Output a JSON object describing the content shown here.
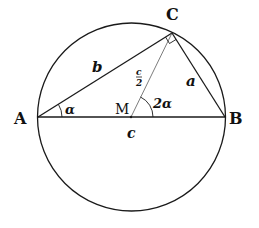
{
  "diagram": {
    "points": {
      "A": {
        "label": "A",
        "x": 38,
        "y": 117
      },
      "B": {
        "label": "B",
        "x": 225,
        "y": 117
      },
      "C": {
        "label": "C",
        "x": 172,
        "y": 33
      },
      "M": {
        "label": "M",
        "x": 131,
        "y": 117
      }
    },
    "circle": {
      "cx": 131.5,
      "cy": 117,
      "r": 94
    },
    "sides": {
      "a": "a",
      "b": "b",
      "c": "c",
      "half_c_num": "c",
      "half_c_den": "2"
    },
    "angles": {
      "alpha": "α",
      "two_alpha": "2α"
    },
    "stroke_color": "#1a1a1a"
  }
}
